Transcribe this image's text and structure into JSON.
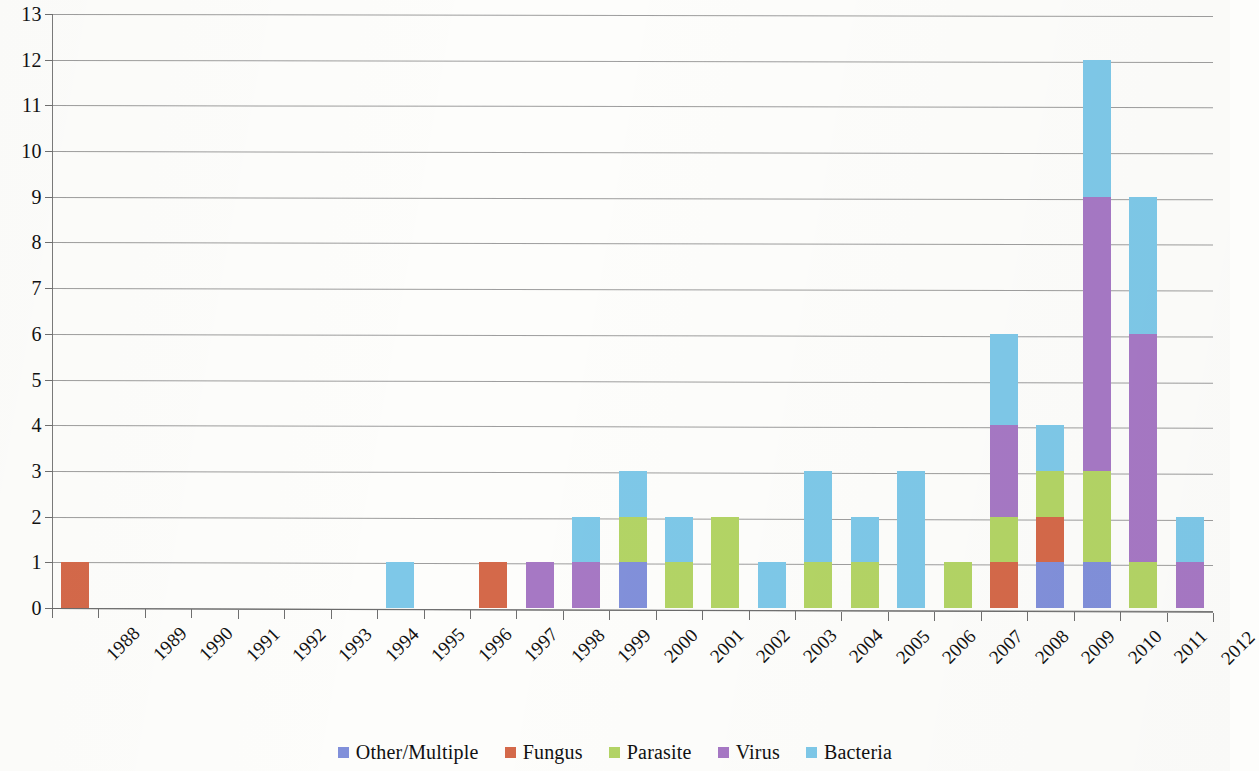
{
  "chart_data": {
    "type": "bar",
    "stacked": true,
    "title": "",
    "xlabel": "",
    "ylabel": "",
    "ylim": [
      0,
      13
    ],
    "ytick_step": 1,
    "yticks": [
      "0",
      "1",
      "2",
      "3",
      "4",
      "5",
      "6",
      "7",
      "8",
      "9",
      "10",
      "11",
      "12",
      "13"
    ],
    "grid": true,
    "grid_axis": "y",
    "legend_position": "bottom",
    "categories": [
      "1988",
      "1989",
      "1990",
      "1991",
      "1992",
      "1993",
      "1994",
      "1995",
      "1996",
      "1997",
      "1998",
      "1999",
      "2000",
      "2001",
      "2002",
      "2003",
      "2004",
      "2005",
      "2006",
      "2007",
      "2008",
      "2009",
      "2010",
      "2011",
      "2012"
    ],
    "series": [
      {
        "name": "Other/Multiple",
        "color": "#8190da",
        "values": [
          0,
          0,
          0,
          0,
          0,
          0,
          0,
          0,
          0,
          0,
          0,
          0,
          1,
          0,
          0,
          0,
          0,
          0,
          0,
          0,
          0,
          1,
          1,
          0,
          0
        ]
      },
      {
        "name": "Fungus",
        "color": "#d4694a",
        "values": [
          1,
          0,
          0,
          0,
          0,
          0,
          0,
          0,
          0,
          1,
          0,
          0,
          0,
          0,
          0,
          0,
          0,
          0,
          0,
          0,
          1,
          1,
          0,
          0,
          0
        ]
      },
      {
        "name": "Parasite",
        "color": "#b3d465",
        "values": [
          0,
          0,
          0,
          0,
          0,
          0,
          0,
          0,
          0,
          0,
          0,
          0,
          1,
          1,
          2,
          0,
          1,
          1,
          0,
          1,
          1,
          1,
          2,
          1,
          0
        ]
      },
      {
        "name": "Virus",
        "color": "#a678c4",
        "values": [
          0,
          0,
          0,
          0,
          0,
          0,
          0,
          0,
          0,
          0,
          1,
          1,
          0,
          0,
          0,
          0,
          0,
          0,
          0,
          0,
          2,
          0,
          6,
          5,
          1
        ]
      },
      {
        "name": "Bacteria",
        "color": "#7ec8e8",
        "values": [
          0,
          0,
          0,
          0,
          0,
          0,
          0,
          1,
          0,
          0,
          0,
          1,
          1,
          1,
          0,
          1,
          2,
          1,
          3,
          0,
          2,
          1,
          3,
          3,
          1
        ]
      }
    ],
    "totals": [
      1,
      0,
      0,
      0,
      0,
      0,
      0,
      1,
      0,
      1,
      1,
      2,
      3,
      2,
      2,
      1,
      3,
      2,
      3,
      1,
      6,
      4,
      12,
      9,
      2
    ]
  },
  "legend": {
    "items": [
      {
        "label": "Other/Multiple",
        "color": "#8190da"
      },
      {
        "label": "Fungus",
        "color": "#d4694a"
      },
      {
        "label": "Parasite",
        "color": "#b3d465"
      },
      {
        "label": "Virus",
        "color": "#a678c4"
      },
      {
        "label": "Bacteria",
        "color": "#7ec8e8"
      }
    ]
  }
}
